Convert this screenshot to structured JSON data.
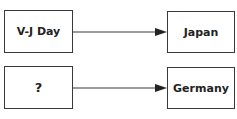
{
  "diagram": {
    "rows": [
      {
        "left": "V-J Day",
        "right": "Japan"
      },
      {
        "left": "?",
        "right": "Germany"
      }
    ],
    "colors": {
      "stroke": "#3a3a3a",
      "text": "#222222",
      "background": "#ffffff"
    }
  }
}
